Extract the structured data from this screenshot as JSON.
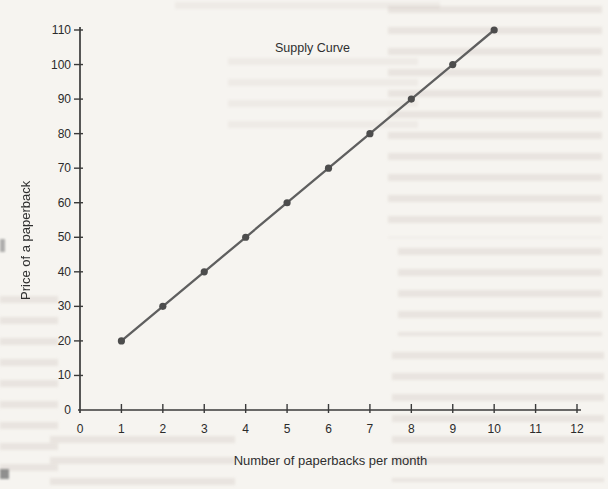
{
  "page": {
    "kind": "scanned textbook chart page",
    "paper_color": "#f6f4f0"
  },
  "chart_data": {
    "type": "line",
    "title": "Supply Curve",
    "xlabel": "Number of paperbacks per month",
    "ylabel": "Price of a paperback",
    "x": [
      1,
      2,
      3,
      4,
      5,
      6,
      7,
      8,
      9,
      10
    ],
    "y": [
      20,
      30,
      40,
      50,
      60,
      70,
      80,
      90,
      100,
      110
    ],
    "xlim": [
      0,
      12
    ],
    "ylim": [
      0,
      110
    ],
    "x_ticks": [
      0,
      1,
      2,
      3,
      4,
      5,
      6,
      7,
      8,
      9,
      10,
      11,
      12
    ],
    "y_ticks": [
      0,
      10,
      20,
      30,
      40,
      50,
      60,
      70,
      80,
      90,
      100,
      110
    ],
    "grid": false,
    "legend": "none",
    "line_color": "#5f5f5f",
    "marker_color": "#4d4d4d",
    "axis_color": "#3a3a3a",
    "tick_label_color": "#2b2b2b"
  }
}
